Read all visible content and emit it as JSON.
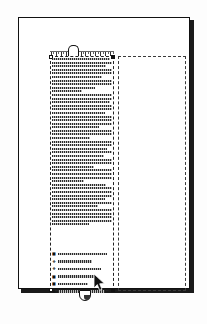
{
  "app": {
    "title": "Page Layout Document",
    "view_label": "page-view"
  },
  "page": {
    "name": "document-page",
    "background_color": "#ffffff",
    "border_color": "#111111",
    "shadow_color": "#1a1a1a"
  },
  "frames": [
    {
      "id": "text-frame-left",
      "label": "Selected text frame",
      "selected": "true",
      "empty": "false",
      "border_style": "dashed",
      "border_color": "#222222"
    },
    {
      "id": "text-frame-right",
      "label": "Linked empty frame",
      "selected": "false",
      "empty": "true",
      "border_style": "dashed",
      "border_color": "#3a3a3a"
    }
  ],
  "handles": {
    "top_left": "resize-handle-top-left",
    "top_right": "resize-handle-top-right",
    "bottom_left": "resize-handle-bottom-left",
    "bottom_right": "resize-handle-bottom-right",
    "in_port": "text-inflow-port",
    "out_port": "text-outflow-port"
  },
  "ruler": {
    "label": "tab-ruler",
    "tick_count": 26
  },
  "text_block": {
    "label": "greeked-body-text",
    "line_widths": [
      96,
      100,
      90,
      100,
      100,
      84,
      100,
      100,
      72,
      50,
      100,
      100,
      96,
      100,
      100,
      88,
      100,
      100,
      100,
      78,
      100,
      100,
      64,
      100,
      100,
      92,
      100,
      86,
      100,
      100,
      70,
      100,
      100,
      100,
      54,
      90,
      100,
      100,
      100,
      88,
      100,
      76,
      100,
      100,
      100,
      100,
      62
    ]
  },
  "list_block": {
    "label": "bulleted-list",
    "items": [
      {
        "bullet": "square-bullet-icon",
        "width": 82
      },
      {
        "bullet": "diamond-bullet-icon",
        "width": 56
      },
      {
        "bullet": "diamond-bullet-icon",
        "width": 72
      },
      {
        "bullet": "square-bullet-icon",
        "width": 64
      },
      {
        "bullet": "square-bullet-icon",
        "width": 50
      },
      {
        "bullet": "diamond-bullet-icon",
        "width": 78
      }
    ]
  },
  "cursor": {
    "label": "mouse-pointer",
    "x": 94,
    "y": 274
  }
}
